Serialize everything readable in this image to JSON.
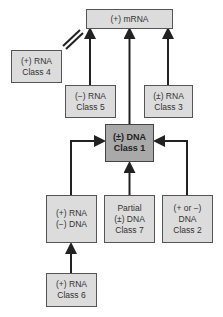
{
  "diagram": {
    "nodes": {
      "mrna": {
        "label": "(+) mRNA"
      },
      "class4": {
        "label": "(+) RNA\nClass 4"
      },
      "class5": {
        "label": "(−) RNA\nClass 5"
      },
      "class3": {
        "label": "(±) RNA\nClass 3"
      },
      "class1": {
        "label": "(±) DNA\nClass 1"
      },
      "rna_dna": {
        "label": "(+) RNA\n(−) DNA"
      },
      "class7": {
        "label": "Partial\n(±) DNA\nClass 7"
      },
      "class2": {
        "label": "(+ or −)\nDNA\nClass 2"
      },
      "class6": {
        "label": "(+) RNA\nClass 6"
      }
    },
    "edges": [
      {
        "from": "class4",
        "to": "mrna",
        "style": "double-line (identity)"
      },
      {
        "from": "class5",
        "to": "mrna",
        "style": "arrow"
      },
      {
        "from": "class1",
        "to": "mrna",
        "style": "arrow"
      },
      {
        "from": "class3",
        "to": "mrna",
        "style": "arrow"
      },
      {
        "from": "rna_dna",
        "to": "class1",
        "style": "arrow"
      },
      {
        "from": "class7",
        "to": "class1",
        "style": "arrow"
      },
      {
        "from": "class2",
        "to": "class1",
        "style": "arrow"
      },
      {
        "from": "class6",
        "to": "rna_dna",
        "style": "arrow"
      }
    ],
    "colors": {
      "box_fill": "#dcdcdc",
      "center_fill": "#a9a9a9",
      "border": "#555555",
      "arrow": "#222222"
    }
  }
}
